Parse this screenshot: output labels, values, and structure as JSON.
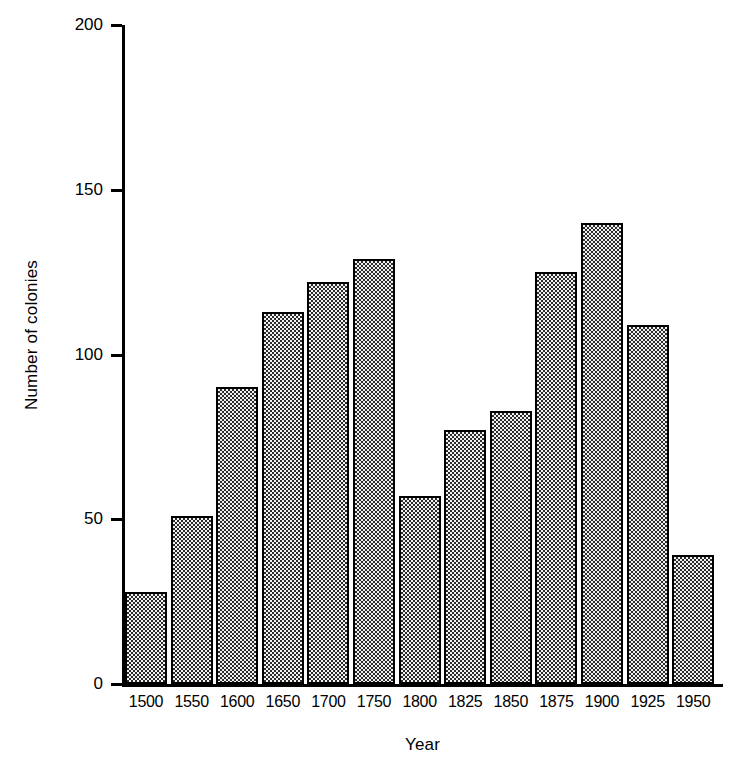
{
  "chart_data": {
    "type": "bar",
    "title": "",
    "xlabel": "Year",
    "ylabel": "Number of colonies",
    "categories": [
      "1500",
      "1550",
      "1600",
      "1650",
      "1700",
      "1750",
      "1800",
      "1825",
      "1850",
      "1875",
      "1900",
      "1925",
      "1950"
    ],
    "values": [
      28,
      51,
      90,
      113,
      122,
      129,
      57,
      77,
      83,
      125,
      140,
      109,
      39
    ],
    "ylim": [
      0,
      200
    ],
    "yticks": [
      0,
      50,
      100,
      150,
      200
    ],
    "ytick_labels": [
      "0",
      "50",
      "100",
      "150",
      "200"
    ],
    "grid": false,
    "legend": null,
    "series": [
      {
        "name": "Number of colonies",
        "values": [
          28,
          51,
          90,
          113,
          122,
          129,
          57,
          77,
          83,
          125,
          140,
          109,
          39
        ]
      }
    ],
    "bar_fill": "#d8d8d8",
    "bar_edge": "#000000",
    "axis_color": "#000000",
    "background": "#ffffff"
  },
  "axes": {
    "y_title": "Number of colonies",
    "x_title": "Year"
  },
  "footer": {
    "clipped_caption": ""
  }
}
